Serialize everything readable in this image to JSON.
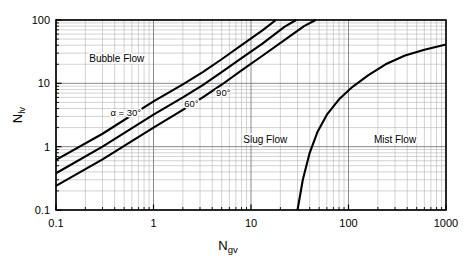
{
  "chart_data": {
    "type": "line",
    "title": "",
    "xlabel": "Ngv",
    "xlabel_main": "N",
    "xlabel_sub": "gv",
    "ylabel": "Nlv",
    "ylabel_main": "N",
    "ylabel_sub": "lv",
    "xscale": "log",
    "yscale": "log",
    "xlim": [
      0.1,
      1000
    ],
    "ylim": [
      0.1,
      100
    ],
    "grid": true,
    "grid_minor": true,
    "legend_position": "none",
    "x_ticks": [
      "0.1",
      "1",
      "10",
      "100",
      "1000"
    ],
    "x_tick_values": [
      0.1,
      1,
      10,
      100,
      1000
    ],
    "y_ticks": [
      "0.1",
      "1",
      "10",
      "100"
    ],
    "y_tick_values": [
      0.1,
      1,
      10,
      100
    ],
    "series": [
      {
        "name": "alpha = 30 deg boundary",
        "label": "α = 30°",
        "color": "#000000",
        "points": [
          [
            0.1,
            0.62
          ],
          [
            0.3,
            1.6
          ],
          [
            1.0,
            5.2
          ],
          [
            2.0,
            9.6
          ],
          [
            3.2,
            15.0
          ],
          [
            5.0,
            24.0
          ],
          [
            8.0,
            40.0
          ],
          [
            13.0,
            68.0
          ],
          [
            18.0,
            100.0
          ]
        ]
      },
      {
        "name": "alpha = 60 deg boundary",
        "label": "60°",
        "color": "#000000",
        "points": [
          [
            0.1,
            0.38
          ],
          [
            0.3,
            1.0
          ],
          [
            1.0,
            3.2
          ],
          [
            2.0,
            6.0
          ],
          [
            3.2,
            9.4
          ],
          [
            5.0,
            15.0
          ],
          [
            8.0,
            25.0
          ],
          [
            13.0,
            42.0
          ],
          [
            22.0,
            78.0
          ],
          [
            29.0,
            100.0
          ]
        ]
      },
      {
        "name": "alpha = 90 deg boundary",
        "label": "90°",
        "color": "#000000",
        "points": [
          [
            0.1,
            0.24
          ],
          [
            0.3,
            0.63
          ],
          [
            1.0,
            2.0
          ],
          [
            2.0,
            3.8
          ],
          [
            3.2,
            6.0
          ],
          [
            5.0,
            9.5
          ],
          [
            8.0,
            16.0
          ],
          [
            13.0,
            27.0
          ],
          [
            22.0,
            48.0
          ],
          [
            35.0,
            80.0
          ],
          [
            46.0,
            100.0
          ]
        ]
      },
      {
        "name": "slug-mist transition boundary",
        "label": "",
        "color": "#000000",
        "points": [
          [
            30.0,
            0.1
          ],
          [
            34.0,
            0.3
          ],
          [
            40.0,
            0.8
          ],
          [
            48.0,
            1.7
          ],
          [
            60.0,
            3.2
          ],
          [
            80.0,
            5.6
          ],
          [
            110.0,
            8.8
          ],
          [
            160.0,
            13.5
          ],
          [
            240.0,
            20.0
          ],
          [
            380.0,
            27.5
          ],
          [
            600.0,
            34.0
          ],
          [
            1000.0,
            41.0
          ]
        ]
      }
    ],
    "annotations": [
      {
        "name": "bubble-flow",
        "text": "Bubble Flow",
        "x": 0.42,
        "y": 22.0
      },
      {
        "name": "slug-flow",
        "text": "Slug Flow",
        "x": 14.0,
        "y": 1.15
      },
      {
        "name": "mist-flow",
        "text": "Mist Flow",
        "x": 300.0,
        "y": 1.15
      },
      {
        "name": "angle-30",
        "text": "α = 30°",
        "x": 0.52,
        "y": 3.1
      },
      {
        "name": "angle-60",
        "text": "60°",
        "x": 2.45,
        "y": 4.2
      },
      {
        "name": "angle-90",
        "text": "90°",
        "x": 5.2,
        "y": 6.4
      }
    ],
    "colors": {
      "curve": "#000000",
      "grid_minor": "#b4b4b4",
      "grid_major": "#7d7d7d",
      "frame": "#000000",
      "background": "#ffffff",
      "text": "#000000"
    }
  }
}
